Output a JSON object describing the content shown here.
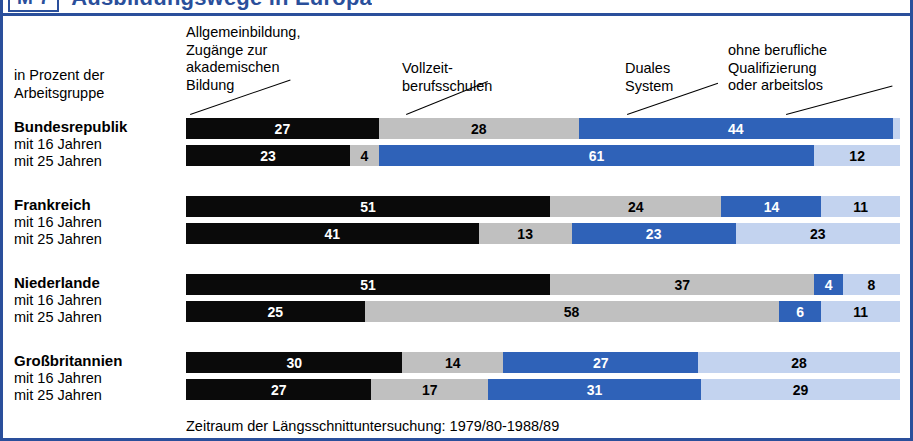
{
  "title": {
    "tag": "M 7",
    "text": "Ausbildungswege in Europa"
  },
  "axis_note": "in Prozent der\nArbeitsgruppe",
  "legend_headers": [
    "Allgemeinbildung,\nZugänge zur\nakademischen\nBildung",
    "Vollzeit-\nberufsschulen",
    "Duales\nSystem",
    "ohne berufliche\nQualifizierung\noder arbeitslos"
  ],
  "footer": "Zeitraum der Längsschnittuntersuchung: 1979/80-1988/89",
  "colors": {
    "brand": "#2a4f9b",
    "series_black": "#0a0a0a",
    "series_gray": "#c0c0c0",
    "series_blue": "#2f62b8",
    "series_lightblue": "#c3d3ef",
    "background": "#ffffff"
  },
  "row_sublabels": [
    "mit 16 Jahren",
    "mit 25 Jahren"
  ],
  "chart_data": {
    "type": "bar",
    "orientation": "horizontal",
    "stacked": true,
    "normalized_total": 100,
    "title": "Ausbildungswege in Europa",
    "xlabel": "in Prozent der Arbeitsgruppe",
    "ylabel": "",
    "xlim": [
      0,
      100
    ],
    "grid": false,
    "legend_position": "top-annotations-with-leader-lines",
    "series": [
      {
        "name": "Allgemeinbildung, Zugänge zur akademischen Bildung",
        "color": "#0a0a0a"
      },
      {
        "name": "Vollzeit-berufsschulen",
        "color": "#c0c0c0"
      },
      {
        "name": "Duales System",
        "color": "#2f62b8"
      },
      {
        "name": "ohne berufliche Qualifizierung oder arbeitslos",
        "color": "#c3d3ef"
      }
    ],
    "groups": [
      {
        "name": "Bundesrepublik",
        "rows": [
          {
            "label": "mit 16 Jahren",
            "values": [
              27,
              28,
              44,
              1
            ]
          },
          {
            "label": "mit 25 Jahren",
            "values": [
              23,
              4,
              61,
              12
            ]
          }
        ]
      },
      {
        "name": "Frankreich",
        "rows": [
          {
            "label": "mit 16 Jahren",
            "values": [
              51,
              24,
              14,
              11
            ]
          },
          {
            "label": "mit 25 Jahren",
            "values": [
              41,
              13,
              23,
              23
            ]
          }
        ]
      },
      {
        "name": "Niederlande",
        "rows": [
          {
            "label": "mit 16 Jahren",
            "values": [
              51,
              37,
              4,
              8
            ]
          },
          {
            "label": "mit 25 Jahren",
            "values": [
              25,
              58,
              6,
              11
            ]
          }
        ]
      },
      {
        "name": "Großbritannien",
        "rows": [
          {
            "label": "mit 16 Jahren",
            "values": [
              30,
              14,
              27,
              28
            ]
          },
          {
            "label": "mit 25 Jahren",
            "values": [
              27,
              17,
              31,
              29
            ]
          }
        ]
      }
    ]
  }
}
